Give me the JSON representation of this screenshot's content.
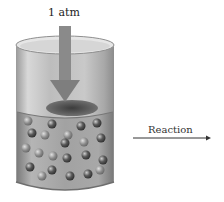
{
  "diagram": {
    "pressure_label": "1 atm",
    "reaction_label": "Reaction",
    "elements": [
      "cylinder",
      "piston",
      "pressure-arrow",
      "gas-molecules",
      "reaction-arrow"
    ],
    "colors": {
      "arrow": "#8a8a8a",
      "cylinder_glass": "#c8c8c8",
      "gas_region": "#9a9a9a",
      "molecule": "#555555",
      "reaction_arrow": "#333333"
    }
  }
}
